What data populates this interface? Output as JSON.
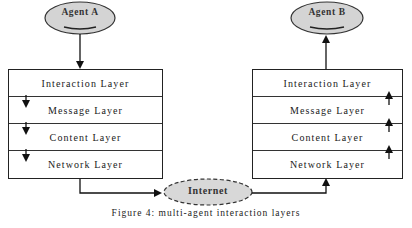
{
  "diagram": {
    "type": "multi-agent interaction layer stack",
    "left_agent": {
      "label": "Agent A"
    },
    "right_agent": {
      "label": "Agent B"
    },
    "network_node": {
      "label": "Internet"
    },
    "left_stack": {
      "direction": "down",
      "layers": [
        {
          "label": "Interaction Layer"
        },
        {
          "label": "Message Layer"
        },
        {
          "label": "Content Layer"
        },
        {
          "label": "Network Layer"
        }
      ]
    },
    "right_stack": {
      "direction": "up",
      "layers": [
        {
          "label": "Interaction Layer"
        },
        {
          "label": "Message Layer"
        },
        {
          "label": "Content Layer"
        },
        {
          "label": "Network Layer"
        }
      ]
    },
    "edges": [
      {
        "from": "Agent A",
        "to": "Interaction Layer (left)"
      },
      {
        "from": "Network Layer (left)",
        "to": "Internet"
      },
      {
        "from": "Internet",
        "to": "Network Layer (right)"
      },
      {
        "from": "Interaction Layer (right)",
        "to": "Agent B"
      }
    ],
    "colors": {
      "ellipse_fill": "#d4d4d4",
      "stroke": "#222222",
      "background": "#ffffff"
    }
  },
  "caption": "Figure 4: multi-agent interaction layers"
}
